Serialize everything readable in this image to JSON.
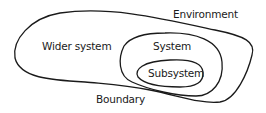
{
  "diagram": {
    "type": "nested-systems",
    "labels": {
      "environment": "Environment",
      "wider_system": "Wider system",
      "system": "System",
      "subsystem": "Subsystem",
      "boundary": "Boundary"
    },
    "stroke_color": "#1a1a1a",
    "background": "#ffffff"
  }
}
